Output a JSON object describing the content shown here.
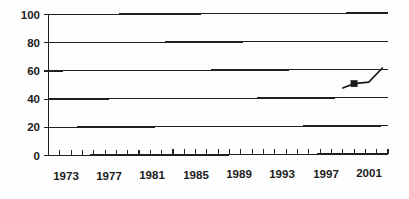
{
  "chart_data": {
    "type": "line",
    "title": "",
    "subtitle": "",
    "xlabel": "",
    "ylabel": "",
    "xlim": [
      1972,
      2002
    ],
    "ylim": [
      0,
      100
    ],
    "grid": true,
    "legend": false,
    "legend_position": "none",
    "y_ticks": [
      0,
      20,
      40,
      60,
      80,
      100
    ],
    "y_tick_labels": [
      "0",
      "20",
      "40",
      "60",
      "80",
      "100"
    ],
    "x_tick_labels": [
      "1973",
      "1977",
      "1981",
      "1985",
      "1989",
      "1993",
      "1997",
      "2001"
    ],
    "x_tick_values": [
      1973,
      1977,
      1981,
      1985,
      1989,
      1993,
      1997,
      2001
    ],
    "x_minor_tick_interval": 1,
    "series": [
      {
        "name": "series-1",
        "marker": "square",
        "color": "#1a1a1a",
        "x": [
          1998.0,
          1999.0,
          2000.3,
          2001.5
        ],
        "values": [
          47,
          50,
          51,
          61
        ]
      }
    ],
    "annotations": []
  },
  "colors": {
    "ink": "#1a1a1a",
    "grid": "#1f1f1f",
    "background": "#fefefe",
    "series": "#1a1a1a"
  },
  "axis": {
    "y_axis_name": "y-axis",
    "x_axis_name": "x-axis"
  }
}
